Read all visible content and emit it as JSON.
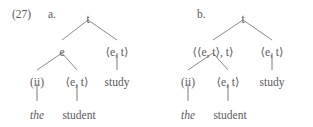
{
  "figure": {
    "example_number": "(27)",
    "text_color": "#5a5a5a",
    "line_color": "#7d7d7d",
    "background": "#ffffff"
  },
  "trees": [
    {
      "letter": "a.",
      "root": {
        "label": "t",
        "x": 88,
        "y": 14
      },
      "nodes": [
        {
          "name": "subject-type",
          "label": "e",
          "x": 62,
          "y": 47
        },
        {
          "name": "predicate-type",
          "label": "⟨e, t⟩",
          "x": 117,
          "y": 47
        },
        {
          "name": "determiner-type",
          "label": "(ii)",
          "x": 37,
          "y": 77
        },
        {
          "name": "noun-type",
          "label": "⟨e, t⟩",
          "x": 77,
          "y": 77
        },
        {
          "name": "verb-word",
          "label": "study",
          "x": 117,
          "y": 77
        },
        {
          "name": "determiner-word",
          "label": "the",
          "x": 37,
          "y": 110,
          "italic": true
        },
        {
          "name": "noun-word",
          "label": "student",
          "x": 79,
          "y": 110
        }
      ],
      "edges": [
        {
          "x1": 88,
          "y1": 20,
          "x2": 62,
          "y2": 40
        },
        {
          "x1": 88,
          "y1": 20,
          "x2": 117,
          "y2": 40
        },
        {
          "x1": 62,
          "y1": 53,
          "x2": 37,
          "y2": 70
        },
        {
          "x1": 62,
          "y1": 53,
          "x2": 77,
          "y2": 70
        },
        {
          "x1": 117,
          "y1": 53,
          "x2": 117,
          "y2": 70
        },
        {
          "x1": 37,
          "y1": 84,
          "x2": 37,
          "y2": 101
        },
        {
          "x1": 77,
          "y1": 84,
          "x2": 77,
          "y2": 101
        }
      ]
    },
    {
      "letter": "b.",
      "root": {
        "label": "t",
        "x": 243,
        "y": 14
      },
      "nodes": [
        {
          "name": "subject-type",
          "label": "⟨⟨e, t⟩, t⟩",
          "x": 213,
          "y": 47
        },
        {
          "name": "predicate-type",
          "label": "⟨e, t⟩",
          "x": 272,
          "y": 47
        },
        {
          "name": "determiner-type",
          "label": "(ii)",
          "x": 188,
          "y": 77
        },
        {
          "name": "noun-type",
          "label": "⟨e, t⟩",
          "x": 228,
          "y": 77
        },
        {
          "name": "verb-word",
          "label": "study",
          "x": 272,
          "y": 77
        },
        {
          "name": "determiner-word",
          "label": "the",
          "x": 188,
          "y": 110,
          "italic": true
        },
        {
          "name": "noun-word",
          "label": "student",
          "x": 230,
          "y": 110
        }
      ],
      "edges": [
        {
          "x1": 243,
          "y1": 20,
          "x2": 213,
          "y2": 40
        },
        {
          "x1": 243,
          "y1": 20,
          "x2": 272,
          "y2": 40
        },
        {
          "x1": 213,
          "y1": 53,
          "x2": 188,
          "y2": 70
        },
        {
          "x1": 213,
          "y1": 53,
          "x2": 228,
          "y2": 70
        },
        {
          "x1": 272,
          "y1": 53,
          "x2": 272,
          "y2": 70
        },
        {
          "x1": 188,
          "y1": 84,
          "x2": 188,
          "y2": 101
        },
        {
          "x1": 228,
          "y1": 84,
          "x2": 228,
          "y2": 101
        }
      ]
    }
  ],
  "labels": {
    "example_number_pos": {
      "x": 12,
      "y": 9
    },
    "letter_a_pos": {
      "x": 48,
      "y": 9
    },
    "letter_b_pos": {
      "x": 197,
      "y": 9
    }
  }
}
